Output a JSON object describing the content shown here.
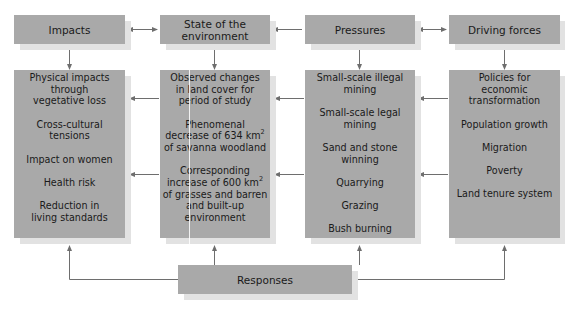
{
  "diagram": {
    "type": "DPSIR framework flow diagram",
    "headers": [
      {
        "id": "impacts",
        "label": "Impacts"
      },
      {
        "id": "state",
        "label": "State of the environment"
      },
      {
        "id": "pressures",
        "label": "Pressures"
      },
      {
        "id": "driving",
        "label": "Driving forces"
      }
    ],
    "columns": {
      "impacts": {
        "items": [
          "Physical impacts through vegetative loss",
          "Cross-cultural tensions",
          "Impact on women",
          "Health risk",
          "Reduction in living standards"
        ]
      },
      "state": {
        "items": [
          "Observed changes in land cover for period of study",
          "Phenomenal decrease of 634km² of savanna woodland",
          "Corresponding increase of 600km² of grasses and barren and built-up environment"
        ],
        "item2_pre": "Phenomenal decrease of 634 km",
        "item2_post": " of savanna woodland",
        "item3_pre": "Corresponding increase of 600 km",
        "item3_post": " of grasses and barren and built-up environment",
        "sup": "2"
      },
      "pressures": {
        "items": [
          "Small-scale illegal mining",
          "Small-scale legal mining",
          "Sand and stone winning",
          "Quarrying",
          "Grazing",
          "Bush burning"
        ]
      },
      "driving": {
        "items": [
          "Policies for economic transformation",
          "Population growth",
          "Migration",
          "Poverty",
          "Land tenure system"
        ]
      }
    },
    "responses": {
      "label": "Responses"
    },
    "colors": {
      "box_fill": "#a9a9a9",
      "box_shadow": "#e2e2e2",
      "arrow": "#6e6e6e",
      "text": "#1a1a1a"
    },
    "edges": [
      {
        "from": "State of the environment",
        "to": "Impacts",
        "type": "bidirectional"
      },
      {
        "from": "Pressures",
        "to": "State of the environment",
        "type": "directed"
      },
      {
        "from": "Pressures",
        "to": "Driving forces",
        "type": "bidirectional"
      },
      {
        "from": "header",
        "to": "column box",
        "type": "directed",
        "note": "each header points down to its column"
      },
      {
        "from": "Driving forces column",
        "to": "Pressures column",
        "type": "directed",
        "count": 2
      },
      {
        "from": "Pressures column",
        "to": "State column",
        "type": "directed",
        "count": 2
      },
      {
        "from": "State column",
        "to": "Impacts column",
        "type": "directed",
        "count": 2
      },
      {
        "from": "Responses",
        "to": "all four columns",
        "type": "directed"
      }
    ]
  }
}
